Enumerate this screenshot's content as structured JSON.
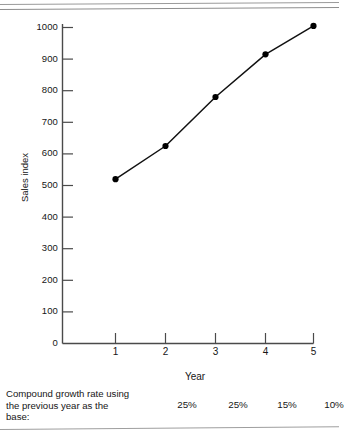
{
  "chart_data": {
    "type": "line",
    "title": "",
    "xlabel": "Year",
    "ylabel": "Sales index",
    "x": [
      1,
      2,
      3,
      4,
      5
    ],
    "values": [
      520,
      625,
      780,
      915,
      1005
    ],
    "xtick_labels": [
      "1",
      "2",
      "3",
      "4",
      "5"
    ],
    "ytick_labels": [
      "0",
      "100",
      "200",
      "300",
      "400",
      "500",
      "600",
      "700",
      "800",
      "900",
      "1000"
    ],
    "yticks": [
      0,
      100,
      200,
      300,
      400,
      500,
      600,
      700,
      800,
      900,
      1000
    ],
    "ylim": [
      0,
      1000
    ],
    "xlim": [
      0,
      5
    ],
    "grid": false,
    "legend": null,
    "marker": "filled-circle",
    "line_color": "#111111",
    "marker_color": "#000000"
  },
  "footnote": {
    "label_lines": [
      "Compound growth rate using",
      "the previous year as the",
      "base:"
    ],
    "rates": [
      "25%",
      "25%",
      "15%",
      "10%"
    ]
  },
  "colors": {
    "axis": "#4a4a4a",
    "line": "#111111",
    "text": "#161616",
    "rule": "#9a9a9a"
  }
}
